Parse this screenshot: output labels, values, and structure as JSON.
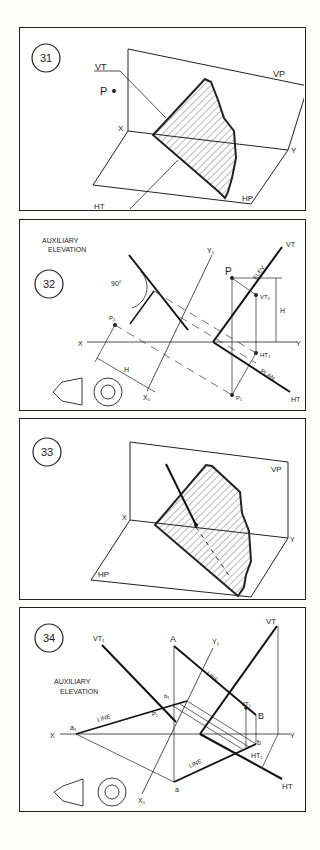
{
  "figures": [
    {
      "number": "31",
      "labels": {
        "vt": "VT",
        "vp": "VP",
        "p": "P",
        "x": "X",
        "y": "Y",
        "ht": "HT",
        "hp": "HP"
      }
    },
    {
      "number": "32",
      "labels": {
        "aux1": "AUXILIARY",
        "aux2": "ELEVATION",
        "angle": "90°",
        "p": "P",
        "p2": "P₂",
        "p1": "P₁",
        "vt": "VT",
        "ht": "HT",
        "vt2": "VT₂",
        "ht2": "HT₂",
        "h1": "H",
        "h2": "H",
        "x": "X",
        "y": "Y",
        "x1": "X₁",
        "y1": "Y₁",
        "elev": "ELEV.",
        "plan": "PLAN"
      }
    },
    {
      "number": "33",
      "labels": {
        "vp": "VP",
        "hp": "HP",
        "x": "X",
        "y": "Y"
      }
    },
    {
      "number": "34",
      "labels": {
        "aux1": "AUXILIARY",
        "aux2": "ELEVATION",
        "vt1a": "VT₁",
        "vt": "VT",
        "a_up": "A",
        "b_up": "B",
        "a1": "a₁",
        "b1": "b₁",
        "p1": "P₁",
        "vt1b": "VT₁",
        "ht1": "HT₁",
        "ht": "HT",
        "a_lo": "a",
        "b_lo": "b",
        "x": "X",
        "y": "Y",
        "x1": "X₁",
        "y1": "Y₁",
        "line1": "LINE",
        "line2": "LINE",
        "line3": "LINE"
      }
    }
  ]
}
